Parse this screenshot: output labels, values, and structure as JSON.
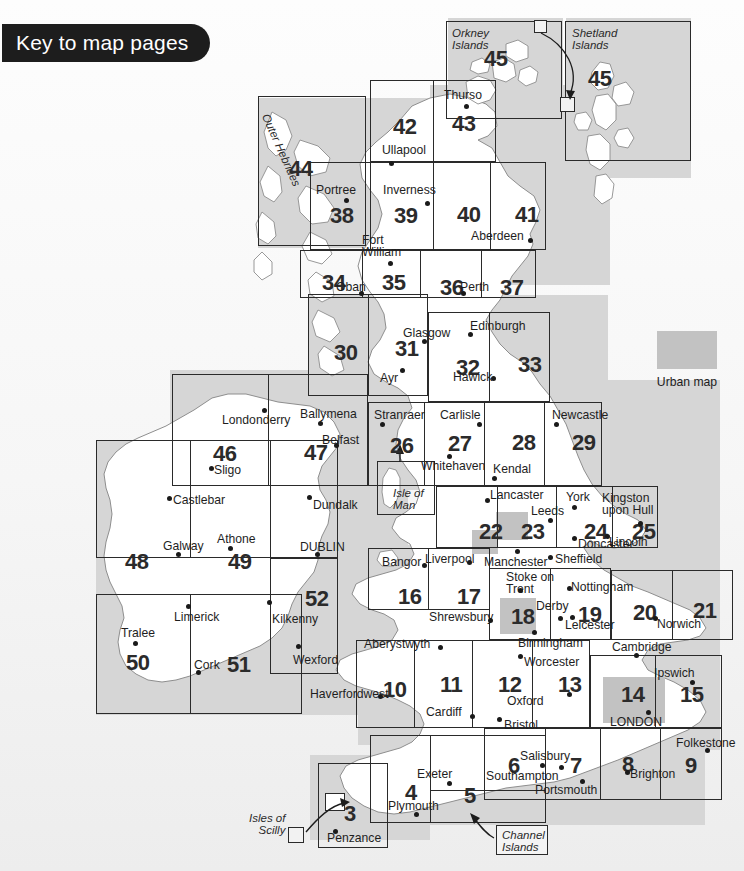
{
  "title": "Key to map pages",
  "legend": {
    "swatch_label": "Urban map",
    "swatch_color": "#c2c2c2"
  },
  "inset_labels": {
    "orkney": "Orkney\nIslands",
    "shetland": "Shetland\nIslands",
    "outer_hebrides": "Outer Hebrides",
    "isle_of_man": "Isle of\nMan",
    "isles_of_scilly": "Isles of\nScilly",
    "channel_islands": "Channel\nIslands"
  },
  "pages": [
    {
      "n": "45",
      "x": 484,
      "y": 48,
      "name": "orkney-islands"
    },
    {
      "n": "45",
      "x": 588,
      "y": 68,
      "name": "shetland-islands"
    },
    {
      "n": "42",
      "x": 393,
      "y": 116,
      "name": "page-42"
    },
    {
      "n": "43",
      "x": 452,
      "y": 113,
      "name": "page-43"
    },
    {
      "n": "44",
      "x": 289,
      "y": 158,
      "name": "outer-hebrides"
    },
    {
      "n": "38",
      "x": 330,
      "y": 205,
      "name": "page-38"
    },
    {
      "n": "39",
      "x": 394,
      "y": 205,
      "name": "page-39"
    },
    {
      "n": "40",
      "x": 457,
      "y": 204,
      "name": "page-40"
    },
    {
      "n": "41",
      "x": 515,
      "y": 204,
      "name": "page-41"
    },
    {
      "n": "34",
      "x": 322,
      "y": 272,
      "name": "page-34"
    },
    {
      "n": "35",
      "x": 382,
      "y": 272,
      "name": "page-35"
    },
    {
      "n": "36",
      "x": 440,
      "y": 277,
      "name": "page-36"
    },
    {
      "n": "37",
      "x": 500,
      "y": 277,
      "name": "page-37"
    },
    {
      "n": "30",
      "x": 334,
      "y": 342,
      "name": "page-30"
    },
    {
      "n": "31",
      "x": 395,
      "y": 338,
      "name": "page-31"
    },
    {
      "n": "32",
      "x": 456,
      "y": 357,
      "name": "page-32"
    },
    {
      "n": "33",
      "x": 518,
      "y": 354,
      "name": "page-33"
    },
    {
      "n": "26",
      "x": 390,
      "y": 435,
      "name": "page-26"
    },
    {
      "n": "27",
      "x": 448,
      "y": 433,
      "name": "page-27"
    },
    {
      "n": "28",
      "x": 512,
      "y": 432,
      "name": "page-28"
    },
    {
      "n": "29",
      "x": 572,
      "y": 432,
      "name": "page-29"
    },
    {
      "n": "46",
      "x": 213,
      "y": 443,
      "name": "page-46"
    },
    {
      "n": "47",
      "x": 304,
      "y": 442,
      "name": "page-47"
    },
    {
      "n": "22",
      "x": 479,
      "y": 521,
      "name": "page-22"
    },
    {
      "n": "23",
      "x": 521,
      "y": 521,
      "name": "page-23"
    },
    {
      "n": "24",
      "x": 584,
      "y": 521,
      "name": "page-24"
    },
    {
      "n": "25",
      "x": 632,
      "y": 521,
      "name": "page-25"
    },
    {
      "n": "48",
      "x": 125,
      "y": 551,
      "name": "page-48"
    },
    {
      "n": "49",
      "x": 228,
      "y": 551,
      "name": "page-49"
    },
    {
      "n": "52",
      "x": 305,
      "y": 588,
      "name": "page-52"
    },
    {
      "n": "16",
      "x": 398,
      "y": 586,
      "name": "page-16"
    },
    {
      "n": "17",
      "x": 457,
      "y": 586,
      "name": "page-17"
    },
    {
      "n": "18",
      "x": 511,
      "y": 606,
      "name": "page-18"
    },
    {
      "n": "19",
      "x": 578,
      "y": 604,
      "name": "page-19"
    },
    {
      "n": "20",
      "x": 633,
      "y": 602,
      "name": "page-20"
    },
    {
      "n": "21",
      "x": 693,
      "y": 600,
      "name": "page-21"
    },
    {
      "n": "50",
      "x": 126,
      "y": 652,
      "name": "page-50"
    },
    {
      "n": "51",
      "x": 227,
      "y": 654,
      "name": "page-51"
    },
    {
      "n": "10",
      "x": 383,
      "y": 679,
      "name": "page-10"
    },
    {
      "n": "11",
      "x": 440,
      "y": 674,
      "name": "page-11"
    },
    {
      "n": "12",
      "x": 498,
      "y": 674,
      "name": "page-12"
    },
    {
      "n": "13",
      "x": 558,
      "y": 674,
      "name": "page-13"
    },
    {
      "n": "14",
      "x": 621,
      "y": 684,
      "name": "page-14"
    },
    {
      "n": "15",
      "x": 680,
      "y": 684,
      "name": "page-15"
    },
    {
      "n": "3",
      "x": 344,
      "y": 803,
      "name": "page-3"
    },
    {
      "n": "4",
      "x": 405,
      "y": 782,
      "name": "page-4"
    },
    {
      "n": "5",
      "x": 464,
      "y": 785,
      "name": "page-5"
    },
    {
      "n": "6",
      "x": 508,
      "y": 755,
      "name": "page-6"
    },
    {
      "n": "7",
      "x": 570,
      "y": 755,
      "name": "page-7"
    },
    {
      "n": "8",
      "x": 622,
      "y": 754,
      "name": "page-8"
    },
    {
      "n": "9",
      "x": 685,
      "y": 755,
      "name": "page-9"
    }
  ],
  "places": [
    {
      "t": "Thurso",
      "x": 444,
      "y": 89,
      "dx": 464,
      "dy": 104
    },
    {
      "t": "Ullapool",
      "x": 382,
      "y": 144,
      "dx": 389,
      "dy": 161
    },
    {
      "t": "Portree",
      "x": 316,
      "y": 184,
      "dx": 344,
      "dy": 198
    },
    {
      "t": "Inverness",
      "x": 383,
      "y": 184,
      "dx": 425,
      "dy": 201
    },
    {
      "t": "Fort\nWilliam",
      "x": 362,
      "y": 234,
      "dx": 388,
      "dy": 261
    },
    {
      "t": "Aberdeen",
      "x": 471,
      "y": 230,
      "dx": 528,
      "dy": 238
    },
    {
      "t": "Oban",
      "x": 336,
      "y": 281,
      "dx": 359,
      "dy": 291
    },
    {
      "t": "Perth",
      "x": 460,
      "y": 281,
      "dx": 461,
      "dy": 291
    },
    {
      "t": "Glasgow",
      "x": 403,
      "y": 327,
      "dx": 422,
      "dy": 339
    },
    {
      "t": "Edinburgh",
      "x": 470,
      "y": 320,
      "dx": 468,
      "dy": 332
    },
    {
      "t": "Ayr",
      "x": 380,
      "y": 372,
      "dx": 400,
      "dy": 368
    },
    {
      "t": "Hawick",
      "x": 453,
      "y": 371,
      "dx": 491,
      "dy": 376
    },
    {
      "t": "Newcastle",
      "x": 552,
      "y": 409,
      "dx": 554,
      "dy": 422
    },
    {
      "t": "Carlisle",
      "x": 440,
      "y": 409,
      "dx": 477,
      "dy": 422
    },
    {
      "t": "Stranraer",
      "x": 374,
      "y": 409,
      "dx": 380,
      "dy": 422
    },
    {
      "t": "Whitehaven",
      "x": 421,
      "y": 460,
      "dx": 447,
      "dy": 454
    },
    {
      "t": "Kendal",
      "x": 493,
      "y": 463,
      "dx": 492,
      "dy": 476
    },
    {
      "t": "Lancaster",
      "x": 490,
      "y": 489,
      "dx": 485,
      "dy": 498
    },
    {
      "t": "York",
      "x": 566,
      "y": 491,
      "dx": 572,
      "dy": 505
    },
    {
      "t": "Kingston\nupon Hull",
      "x": 602,
      "y": 492,
      "dx": 638,
      "dy": 521
    },
    {
      "t": "Leeds",
      "x": 531,
      "y": 505,
      "dx": 548,
      "dy": 518
    },
    {
      "t": "Doncaster",
      "x": 578,
      "y": 538,
      "dx": 572,
      "dy": 536
    },
    {
      "t": "Lincoln",
      "x": 609,
      "y": 536,
      "dx": 605,
      "dy": 534
    },
    {
      "t": "Londonderry",
      "x": 222,
      "y": 414,
      "dx": 262,
      "dy": 408
    },
    {
      "t": "Ballymena",
      "x": 300,
      "y": 408,
      "dx": 318,
      "dy": 421
    },
    {
      "t": "Belfast",
      "x": 322,
      "y": 434,
      "dx": 334,
      "dy": 443
    },
    {
      "t": "Sligo",
      "x": 214,
      "y": 464,
      "dx": 209,
      "dy": 466
    },
    {
      "t": "Castlebar",
      "x": 173,
      "y": 494,
      "dx": 167,
      "dy": 496
    },
    {
      "t": "Dundalk",
      "x": 313,
      "y": 499,
      "dx": 307,
      "dy": 495
    },
    {
      "t": "Athone",
      "x": 217,
      "y": 533,
      "dx": 228,
      "dy": 546
    },
    {
      "t": "Galway",
      "x": 163,
      "y": 540,
      "dx": 176,
      "dy": 552
    },
    {
      "t": "DUBLIN",
      "x": 300,
      "y": 541,
      "dx": 315,
      "dy": 552
    },
    {
      "t": "Kilkenny",
      "x": 272,
      "y": 613,
      "dx": 267,
      "dy": 600
    },
    {
      "t": "Limerick",
      "x": 174,
      "y": 611,
      "dx": 186,
      "dy": 604
    },
    {
      "t": "Tralee",
      "x": 121,
      "y": 627,
      "dx": 133,
      "dy": 641
    },
    {
      "t": "Cork",
      "x": 194,
      "y": 659,
      "dx": 196,
      "dy": 670
    },
    {
      "t": "Wexford",
      "x": 293,
      "y": 654,
      "dx": 296,
      "dy": 644
    },
    {
      "t": "Bangor",
      "x": 382,
      "y": 556,
      "dx": 422,
      "dy": 563
    },
    {
      "t": "Liverpool",
      "x": 425,
      "y": 553,
      "dx": 467,
      "dy": 560
    },
    {
      "t": "Manchester",
      "x": 484,
      "y": 556,
      "dx": 515,
      "dy": 549
    },
    {
      "t": "Sheffield",
      "x": 555,
      "y": 553,
      "dx": 548,
      "dy": 555
    },
    {
      "t": "Stoke on\nTrent",
      "x": 506,
      "y": 571,
      "dx": 518,
      "dy": 588
    },
    {
      "t": "Nottingham",
      "x": 571,
      "y": 581,
      "dx": 567,
      "dy": 586
    },
    {
      "t": "Derby",
      "x": 536,
      "y": 600,
      "dx": 558,
      "dy": 616
    },
    {
      "t": "Leicester",
      "x": 565,
      "y": 619,
      "dx": 570,
      "dy": 615
    },
    {
      "t": "Norwich",
      "x": 657,
      "y": 618,
      "dx": 653,
      "dy": 616
    },
    {
      "t": "Shrewsbury",
      "x": 429,
      "y": 611,
      "dx": 488,
      "dy": 618
    },
    {
      "t": "Aberystwyth",
      "x": 364,
      "y": 638,
      "dx": 438,
      "dy": 645
    },
    {
      "t": "Birmingham",
      "x": 518,
      "y": 637,
      "dx": 532,
      "dy": 630
    },
    {
      "t": "Worcester",
      "x": 524,
      "y": 656,
      "dx": 518,
      "dy": 654
    },
    {
      "t": "Cambridge",
      "x": 612,
      "y": 641,
      "dx": 634,
      "dy": 653
    },
    {
      "t": "Ipswich",
      "x": 654,
      "y": 667,
      "dx": 690,
      "dy": 680
    },
    {
      "t": "Haverfordwest",
      "x": 310,
      "y": 688,
      "dx": 378,
      "dy": 694
    },
    {
      "t": "Oxford",
      "x": 507,
      "y": 695,
      "dx": 567,
      "dy": 692
    },
    {
      "t": "Cardiff",
      "x": 426,
      "y": 706,
      "dx": 470,
      "dy": 714
    },
    {
      "t": "Bristol",
      "x": 504,
      "y": 719,
      "dx": 497,
      "dy": 717
    },
    {
      "t": "LONDON",
      "x": 610,
      "y": 716,
      "dx": 646,
      "dy": 710
    },
    {
      "t": "Folkestone",
      "x": 676,
      "y": 737,
      "dx": 705,
      "dy": 748
    },
    {
      "t": "Salisbury",
      "x": 520,
      "y": 750,
      "dx": 540,
      "dy": 763
    },
    {
      "t": "Southampton",
      "x": 486,
      "y": 770,
      "dx": 559,
      "dy": 765
    },
    {
      "t": "Portsmouth",
      "x": 535,
      "y": 784,
      "dx": 580,
      "dy": 779
    },
    {
      "t": "Brighton",
      "x": 630,
      "y": 768,
      "dx": 625,
      "dy": 770
    },
    {
      "t": "Exeter",
      "x": 417,
      "y": 768,
      "dx": 447,
      "dy": 781
    },
    {
      "t": "Plymouth",
      "x": 388,
      "y": 800,
      "dx": 414,
      "dy": 812
    },
    {
      "t": "Penzance",
      "x": 327,
      "y": 832,
      "dx": 333,
      "dy": 829
    }
  ]
}
